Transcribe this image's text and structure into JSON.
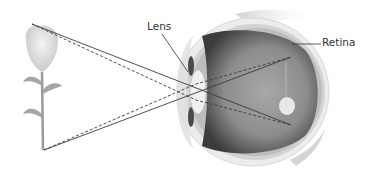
{
  "diagram": {
    "labels": {
      "lens": "Lens",
      "retina": "Retina"
    },
    "object": "flower",
    "colors": {
      "background": "#ffffff",
      "ray": "#3a3a3a",
      "eye_interior": "#8a8a8a",
      "sclera": "#e6e6e6",
      "flower_petal": "#dcdcdc",
      "stem": "#9a9a9a",
      "label_text": "#333333"
    }
  }
}
